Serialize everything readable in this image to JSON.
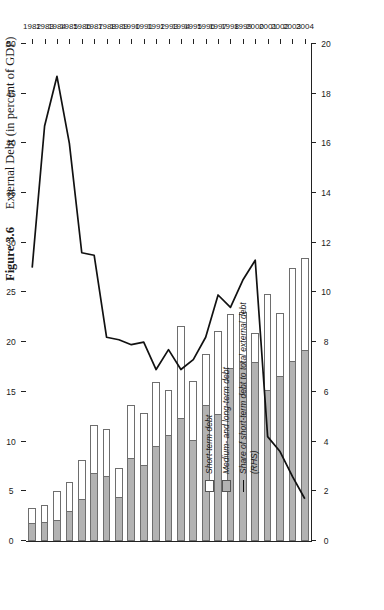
{
  "figure": {
    "number": "Figure 3.6",
    "caption": "External Debt (in percent of GDP)"
  },
  "legend": {
    "items": [
      {
        "key": "swatch-white",
        "label": "Short-term debt"
      },
      {
        "key": "swatch-gray",
        "label": "Medium- and long-term debt"
      },
      {
        "key": "line",
        "label": "Share of short-term debt to total external debt\n(RHS)"
      }
    ]
  },
  "axes": {
    "left_title": "",
    "left_ticks": [
      "0",
      "5",
      "10",
      "15",
      "20",
      "25",
      "30",
      "35",
      "40",
      "45",
      "50"
    ],
    "right_ticks": [
      "0",
      "2",
      "4",
      "6",
      "8",
      "10",
      "12",
      "14",
      "16",
      "18",
      "20"
    ],
    "left_range": [
      0,
      50
    ],
    "right_range": [
      0,
      20
    ]
  },
  "chart_data": {
    "type": "bar",
    "orientation": "horizontal-rotated",
    "title": "External Debt (in percent of GDP)",
    "xlabel": "",
    "ylabel": "in percent of GDP",
    "ylim": [
      0,
      50
    ],
    "y2lim": [
      0,
      20
    ],
    "y2label": "Share of short-term debt to total external debt (RHS)",
    "grid": false,
    "legend_position": "inside-left",
    "categories": [
      "1982",
      "1983",
      "1984",
      "1985",
      "1986",
      "1987",
      "1988",
      "1989",
      "1990",
      "1991",
      "1992",
      "1993",
      "1994",
      "1995",
      "1996",
      "1997",
      "1998",
      "1999",
      "2000",
      "2001",
      "2002",
      "2003",
      "2004"
    ],
    "series": [
      {
        "name": "Medium- and long-term debt",
        "type": "bar",
        "stack": "debt",
        "color": "#b3b3b3",
        "values": [
          1.8,
          1.9,
          2.1,
          3.0,
          4.2,
          6.8,
          6.5,
          4.4,
          8.3,
          7.6,
          9.6,
          10.7,
          12.4,
          10.2,
          13.7,
          12.8,
          17.4,
          18.0,
          18.0,
          15.2,
          16.6,
          18.1,
          19.2
        ]
      },
      {
        "name": "Short-term debt",
        "type": "bar",
        "stack": "debt",
        "color": "#ffffff",
        "values": [
          1.5,
          1.7,
          2.9,
          2.9,
          3.9,
          4.9,
          4.8,
          2.9,
          5.4,
          5.3,
          6.4,
          4.5,
          9.2,
          5.9,
          5.1,
          8.3,
          5.4,
          5.0,
          2.9,
          9.6,
          6.3,
          9.4,
          9.3
        ]
      },
      {
        "name": "Share of short-term debt to total external debt (RHS)",
        "type": "line",
        "axis": "right",
        "color": "#111111",
        "values": [
          11.0,
          16.7,
          18.7,
          16.0,
          11.6,
          11.5,
          8.2,
          8.1,
          7.9,
          8.0,
          6.9,
          7.7,
          6.9,
          7.3,
          8.2,
          9.9,
          9.4,
          10.5,
          11.3,
          4.2,
          3.6,
          2.6,
          1.7
        ]
      }
    ]
  }
}
